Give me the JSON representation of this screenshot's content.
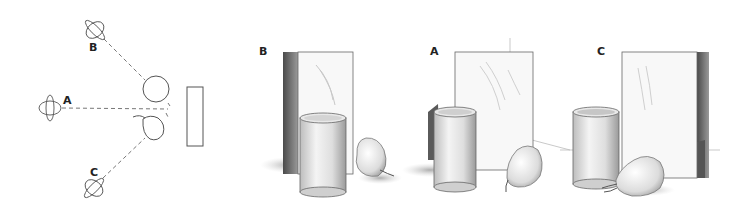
{
  "diagram": {
    "plan_view": {
      "viewpoints": [
        {
          "id": "B",
          "label": "B",
          "eye_x": 102,
          "eye_y": 38
        },
        {
          "id": "A",
          "label": "A",
          "eye_x": 60,
          "eye_y": 108
        },
        {
          "id": "C",
          "label": "C",
          "eye_x": 102,
          "eye_y": 180
        }
      ],
      "objects": [
        "cylinder",
        "pear",
        "box"
      ]
    },
    "views": [
      {
        "id": "B",
        "label": "B"
      },
      {
        "id": "A",
        "label": "A"
      },
      {
        "id": "C",
        "label": "C"
      }
    ],
    "colors": {
      "line": "#555555",
      "shade_dark": "#6b6b6b",
      "shade_mid": "#a8a8a8",
      "shade_light": "#d9d9d9"
    }
  }
}
